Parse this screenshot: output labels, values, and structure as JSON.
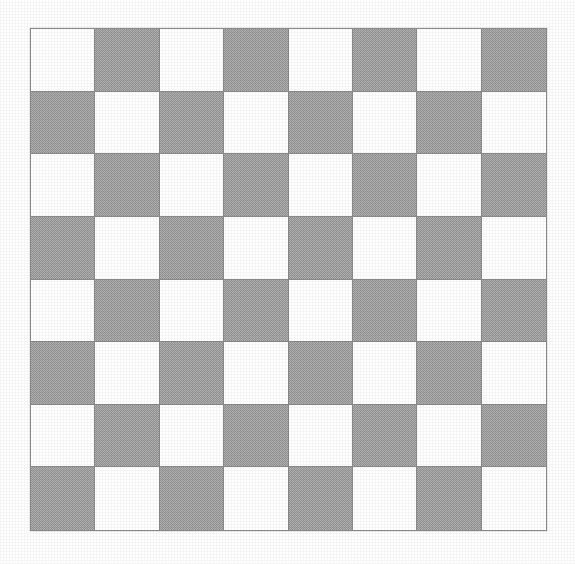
{
  "page": {
    "background_color": "#ffffff",
    "width": 575,
    "height": 564
  },
  "board": {
    "name": "checkerboard",
    "rows": 8,
    "columns": 8,
    "square_count": 64,
    "top_left_square_color": "light",
    "light_color": "#ffffff",
    "dark_color": "#ababab",
    "gridline_color": "#8a8a8a",
    "border_color": "#8d8d8d",
    "geometry": {
      "left": 30,
      "top": 28,
      "width": 517,
      "height": 503,
      "square_width": 64.6,
      "square_height": 62.9
    },
    "pattern": [
      [
        "light",
        "dark",
        "light",
        "dark",
        "light",
        "dark",
        "light",
        "dark"
      ],
      [
        "dark",
        "light",
        "dark",
        "light",
        "dark",
        "light",
        "dark",
        "light"
      ],
      [
        "light",
        "dark",
        "light",
        "dark",
        "light",
        "dark",
        "light",
        "dark"
      ],
      [
        "dark",
        "light",
        "dark",
        "light",
        "dark",
        "light",
        "dark",
        "light"
      ],
      [
        "light",
        "dark",
        "light",
        "dark",
        "light",
        "dark",
        "light",
        "dark"
      ],
      [
        "dark",
        "light",
        "dark",
        "light",
        "dark",
        "light",
        "dark",
        "light"
      ],
      [
        "light",
        "dark",
        "light",
        "dark",
        "light",
        "dark",
        "light",
        "dark"
      ],
      [
        "dark",
        "light",
        "dark",
        "light",
        "dark",
        "light",
        "dark",
        "light"
      ]
    ]
  }
}
